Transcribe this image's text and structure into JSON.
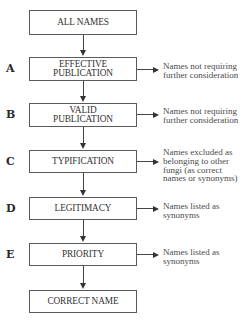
{
  "diagram": {
    "start": "ALL NAMES",
    "steps": [
      {
        "letter": "A",
        "label_line1": "EFFECTIVE",
        "label_line2": "PUBLICATION",
        "note": "Names not requiring\nfurther consideration"
      },
      {
        "letter": "B",
        "label_line1": "VALID",
        "label_line2": "PUBLICATION",
        "note": "Names not requiring\nfurther consideration"
      },
      {
        "letter": "C",
        "label_line1": "TYPIFICATION",
        "label_line2": "",
        "note": "Names excluded as\nbelonging to other\nfungi (as correct\nnames or synonyms)"
      },
      {
        "letter": "D",
        "label_line1": "LEGITIMACY",
        "label_line2": "",
        "note": "Names listed as\nsynonyms"
      },
      {
        "letter": "E",
        "label_line1": "PRIORITY",
        "label_line2": "",
        "note": "Names listed as\nsynonyms"
      }
    ],
    "end": "CORRECT NAME"
  }
}
